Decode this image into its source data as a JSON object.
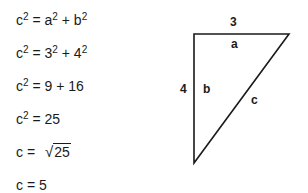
{
  "equations": [
    {
      "lhs": "c",
      "lhs_exp": "2",
      "eq": " = ",
      "t1": "a",
      "t1_exp": "2",
      "op": " + ",
      "t2": "b",
      "t2_exp": "2"
    },
    {
      "lhs": "c",
      "lhs_exp": "2",
      "eq": " = ",
      "t1": "3",
      "t1_exp": "2",
      "op": " + ",
      "t2": "4",
      "t2_exp": "2"
    },
    {
      "lhs": "c",
      "lhs_exp": "2",
      "eq": " = ",
      "rhs": "9 + 16"
    },
    {
      "lhs": "c",
      "lhs_exp": "2",
      "eq": " = ",
      "rhs": "25"
    },
    {
      "lhs": "c",
      "eq": " = ",
      "sqrt_sign": "√",
      "radicand": "25"
    },
    {
      "lhs": "c",
      "eq": " = ",
      "rhs": "5"
    }
  ],
  "triangle": {
    "vertices": {
      "top_left": [
        194,
        34
      ],
      "top_right": [
        289,
        34
      ],
      "bottom": [
        194,
        163
      ]
    },
    "side_values": {
      "top": "3",
      "left": "4"
    },
    "side_names": {
      "top": "a",
      "left": "b",
      "hypotenuse": "c"
    },
    "stroke_color": "#1a1a1a"
  }
}
